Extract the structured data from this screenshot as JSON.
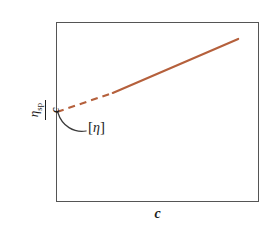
{
  "chart_data": {
    "type": "line",
    "title": "",
    "subtitle": "",
    "xlabel": "c",
    "ylabel_numerator": "η",
    "ylabel_numerator_subscript": "sp",
    "ylabel_denominator": "c",
    "ylabel_full": "ηsp / c",
    "grid": false,
    "legend": null,
    "xlim": [
      0,
      1
    ],
    "ylim": [
      0,
      1
    ],
    "xticks": [],
    "yticks": [],
    "annotations": [
      {
        "text": "[η]",
        "bracket_open": "[",
        "symbol": "η",
        "bracket_close": "]",
        "meaning": "intrinsic-viscosity-intercept"
      }
    ],
    "series": [
      {
        "name": "huggins-extrapolation",
        "style": "dashed",
        "color": "#b5603c",
        "points": [
          [
            0.0,
            0.5
          ],
          [
            0.276,
            0.606
          ]
        ]
      },
      {
        "name": "measured-data-line",
        "style": "solid",
        "color": "#b5603c",
        "points": [
          [
            0.276,
            0.606
          ],
          [
            0.897,
            0.906
          ]
        ]
      }
    ],
    "intercept_point": [
      0.0,
      0.5
    ],
    "colors": {
      "line": "#b5603c",
      "frame": "#555555",
      "text": "#1d1d1d",
      "background": "#ffffff"
    }
  }
}
